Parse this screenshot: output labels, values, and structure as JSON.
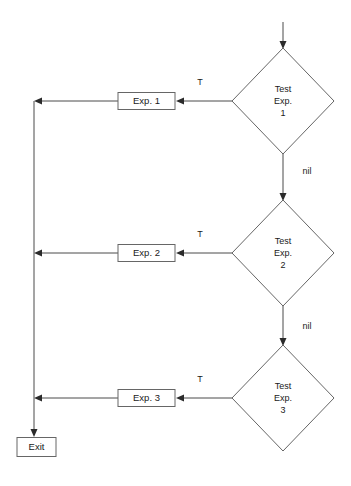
{
  "diagram": {
    "colors": {
      "background": "#ffffff",
      "shape_stroke": "#666666",
      "shape_fill": "#ffffff",
      "edge_stroke": "#4a4a4a",
      "arrow_fill": "#2b2b2b",
      "text": "#1a1a1a"
    },
    "decisions": [
      {
        "id": "test-exp-1",
        "line1": "Test",
        "line2": "Exp.",
        "line3": "1"
      },
      {
        "id": "test-exp-2",
        "line1": "Test",
        "line2": "Exp.",
        "line3": "2"
      },
      {
        "id": "test-exp-3",
        "line1": "Test",
        "line2": "Exp.",
        "line3": "3"
      }
    ],
    "processes": [
      {
        "id": "exp-1",
        "label": "Exp. 1"
      },
      {
        "id": "exp-2",
        "label": "Exp. 2"
      },
      {
        "id": "exp-3",
        "label": "Exp. 3"
      }
    ],
    "terminal": {
      "id": "exit",
      "label": "Exit"
    },
    "edge_labels": {
      "true_1": "T",
      "true_2": "T",
      "true_3": "T",
      "nil_1": "nil",
      "nil_2": "nil"
    }
  }
}
